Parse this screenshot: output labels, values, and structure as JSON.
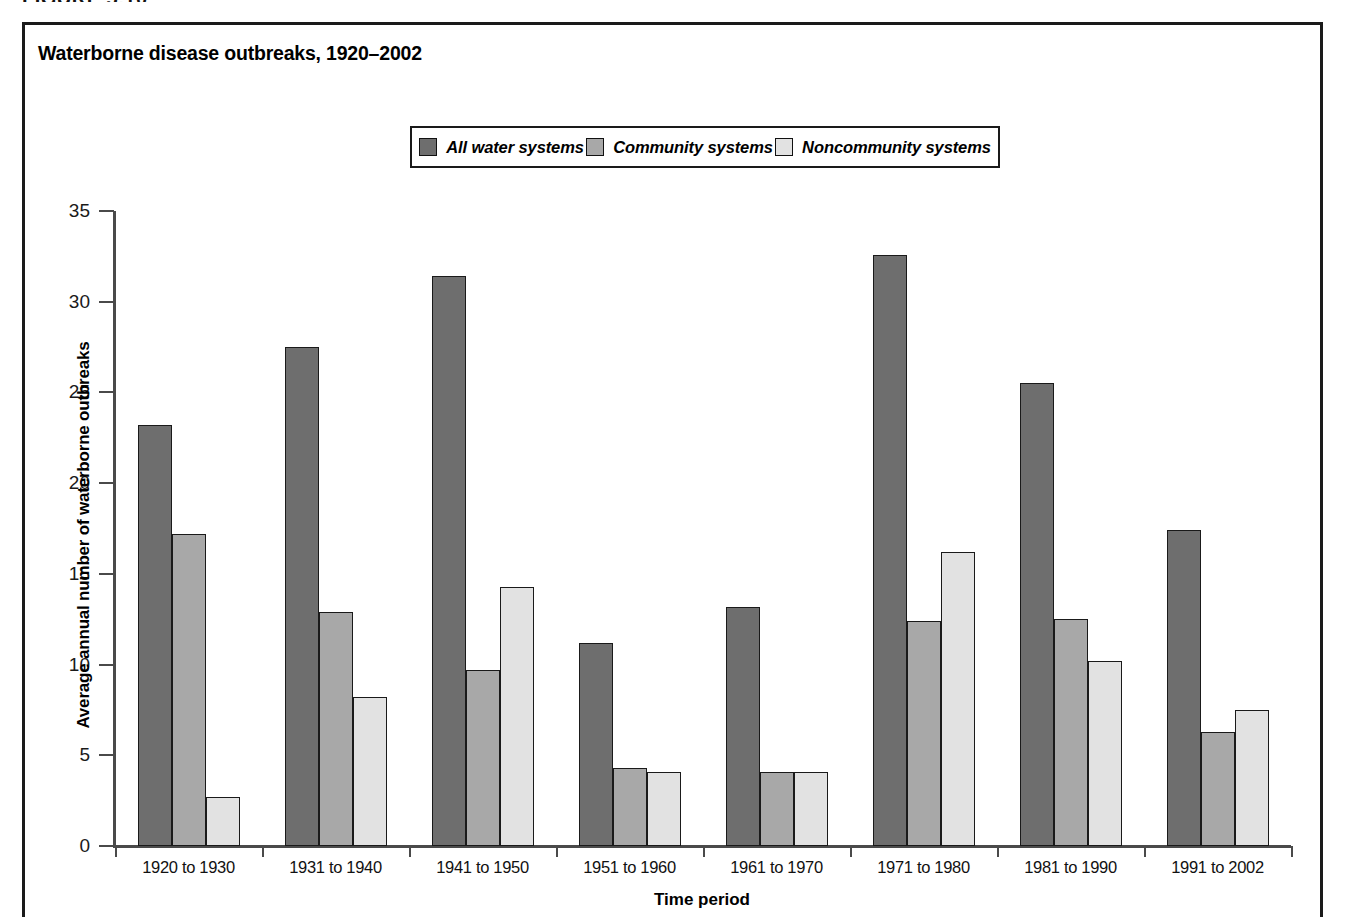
{
  "figure": {
    "heading": "FIGURE 5.10",
    "title": "Waterborne disease outbreaks, 1920–2002"
  },
  "legend": {
    "position": "top-center",
    "items": [
      {
        "label": "All water systems",
        "color": "#6e6e6e",
        "swatch_name": "legend-swatch-all-water-systems"
      },
      {
        "label": "Community systems",
        "color": "#a8a8a8",
        "swatch_name": "legend-swatch-community-systems"
      },
      {
        "label": "Noncommunity systems",
        "color": "#e2e2e2",
        "swatch_name": "legend-swatch-noncommunity-systems"
      }
    ]
  },
  "axes": {
    "y_title": "Average annual number of waterborne outbreaks",
    "x_title": "Time period",
    "y_ticks": [
      "0",
      "5",
      "10",
      "15",
      "20",
      "25",
      "30",
      "35"
    ]
  },
  "chart_data": {
    "type": "bar",
    "title": "Waterborne disease outbreaks, 1920–2002",
    "xlabel": "Time period",
    "ylabel": "Average annual number of waterborne outbreaks",
    "ylim": [
      0,
      35
    ],
    "ytick_step": 5,
    "grid": false,
    "legend_position": "top-center",
    "categories": [
      "1920 to 1930",
      "1931 to 1940",
      "1941 to 1950",
      "1951 to 1960",
      "1961 to 1970",
      "1971 to 1980",
      "1981 to 1990",
      "1991 to 2002"
    ],
    "series": [
      {
        "name": "All water systems",
        "color": "#6e6e6e",
        "values": [
          23.2,
          27.5,
          31.4,
          11.2,
          13.2,
          32.6,
          25.5,
          17.4
        ]
      },
      {
        "name": "Community systems",
        "color": "#a8a8a8",
        "values": [
          17.2,
          12.9,
          9.7,
          4.3,
          4.1,
          12.4,
          12.5,
          6.3
        ]
      },
      {
        "name": "Noncommunity systems",
        "color": "#e2e2e2",
        "values": [
          2.7,
          8.2,
          14.3,
          4.1,
          4.1,
          16.2,
          10.2,
          7.5
        ]
      }
    ]
  }
}
